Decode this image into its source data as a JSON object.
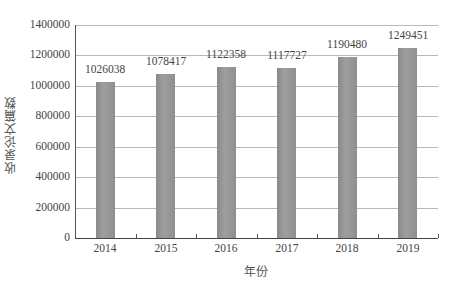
{
  "chart_data": {
    "type": "bar",
    "title": "",
    "xlabel": "年份",
    "ylabel": "收录论文篇数",
    "categories": [
      "2014",
      "2015",
      "2016",
      "2017",
      "2018",
      "2019"
    ],
    "values": [
      1026038,
      1078417,
      1122358,
      1117727,
      1190480,
      1249451
    ],
    "data_labels": [
      "1026038",
      "1078417",
      "1122358",
      "1117727",
      "1190480",
      "1249451"
    ],
    "ylim": [
      0,
      1400000
    ],
    "yticks": [
      "0",
      "200000",
      "400000",
      "600000",
      "800000",
      "1000000",
      "1200000",
      "1400000"
    ],
    "grid": true,
    "legend": null,
    "bar_color": "#939393"
  }
}
